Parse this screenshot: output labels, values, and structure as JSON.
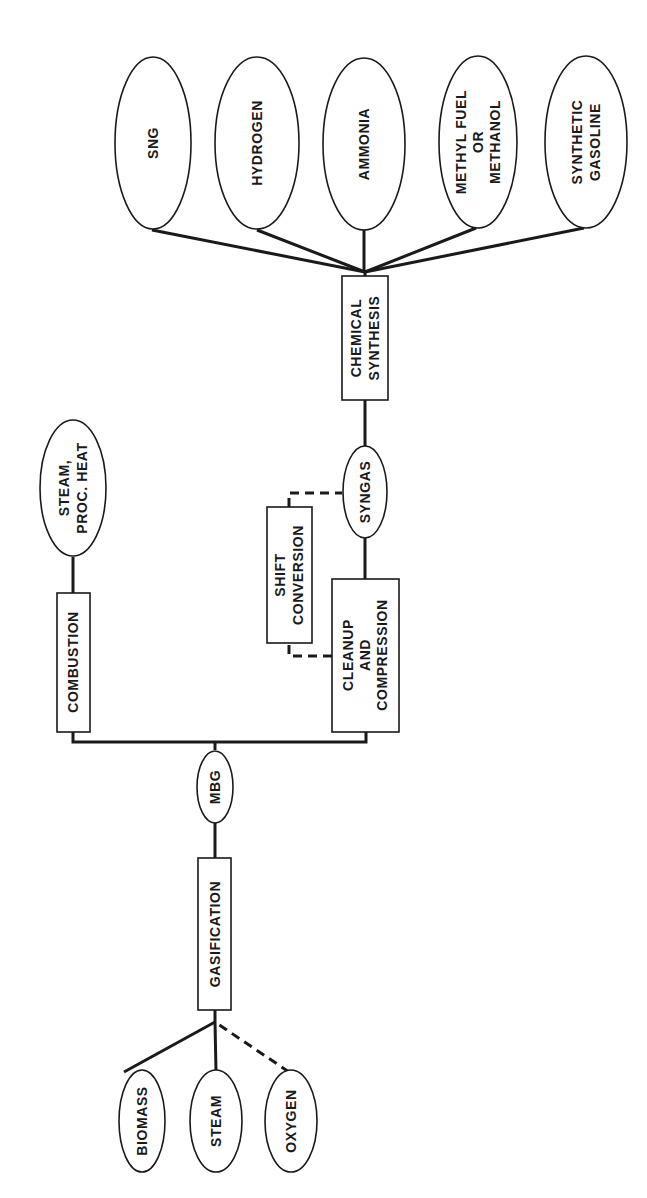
{
  "diagram": {
    "orientation": "rotated-90-ccw",
    "inputs": [
      {
        "id": "biomass",
        "label": [
          "BIOMASS"
        ],
        "shape": "ellipse"
      },
      {
        "id": "steam",
        "label": [
          "STEAM"
        ],
        "shape": "ellipse"
      },
      {
        "id": "oxygen",
        "label": [
          "OXYGEN"
        ],
        "shape": "ellipse",
        "connection": "dashed"
      }
    ],
    "processes": [
      {
        "id": "gasification",
        "label": [
          "GASIFICATION"
        ],
        "shape": "box"
      },
      {
        "id": "mbg",
        "label": [
          "MBG"
        ],
        "shape": "ellipse"
      },
      {
        "id": "combustion",
        "label": [
          "COMBUSTION"
        ],
        "shape": "box"
      },
      {
        "id": "steam_proc_heat",
        "label": [
          "STEAM,",
          "PROC. HEAT"
        ],
        "shape": "ellipse"
      },
      {
        "id": "cleanup",
        "label": [
          "CLEANUP",
          "AND",
          "COMPRESSION"
        ],
        "shape": "box"
      },
      {
        "id": "shift",
        "label": [
          "SHIFT",
          "CONVERSION"
        ],
        "shape": "box"
      },
      {
        "id": "syngas",
        "label": [
          "SYNGAS"
        ],
        "shape": "ellipse"
      },
      {
        "id": "chemical_synthesis",
        "label": [
          "CHEMICAL",
          "SYNTHESIS"
        ],
        "shape": "box"
      }
    ],
    "products": [
      {
        "id": "sng",
        "label": [
          "SNG"
        ],
        "shape": "ellipse"
      },
      {
        "id": "hydrogen",
        "label": [
          "HYDROGEN"
        ],
        "shape": "ellipse"
      },
      {
        "id": "ammonia",
        "label": [
          "AMMONIA"
        ],
        "shape": "ellipse"
      },
      {
        "id": "methyl",
        "label": [
          "METHYL FUEL",
          "OR",
          "METHANOL"
        ],
        "shape": "ellipse"
      },
      {
        "id": "gasoline",
        "label": [
          "SYNTHETIC",
          "GASOLINE"
        ],
        "shape": "ellipse"
      }
    ],
    "edges": [
      {
        "from": "biomass",
        "to": "gasification",
        "style": "solid"
      },
      {
        "from": "steam",
        "to": "gasification",
        "style": "solid"
      },
      {
        "from": "oxygen",
        "to": "gasification",
        "style": "dashed"
      },
      {
        "from": "gasification",
        "to": "mbg",
        "style": "solid"
      },
      {
        "from": "mbg",
        "to": "combustion",
        "style": "solid"
      },
      {
        "from": "combustion",
        "to": "steam_proc_heat",
        "style": "solid"
      },
      {
        "from": "mbg",
        "to": "cleanup",
        "style": "solid"
      },
      {
        "from": "cleanup",
        "to": "shift",
        "style": "dashed"
      },
      {
        "from": "shift",
        "to": "syngas",
        "style": "dashed"
      },
      {
        "from": "cleanup",
        "to": "syngas",
        "style": "solid"
      },
      {
        "from": "syngas",
        "to": "chemical_synthesis",
        "style": "solid"
      },
      {
        "from": "chemical_synthesis",
        "to": "sng",
        "style": "solid"
      },
      {
        "from": "chemical_synthesis",
        "to": "hydrogen",
        "style": "solid"
      },
      {
        "from": "chemical_synthesis",
        "to": "ammonia",
        "style": "solid"
      },
      {
        "from": "chemical_synthesis",
        "to": "methyl",
        "style": "solid"
      },
      {
        "from": "chemical_synthesis",
        "to": "gasoline",
        "style": "solid"
      }
    ]
  },
  "labels": {
    "biomass": "BIOMASS",
    "steam": "STEAM",
    "oxygen": "OXYGEN",
    "gasification": "GASIFICATION",
    "mbg": "MBG",
    "combustion": "COMBUSTION",
    "steam_proc_heat_1": "STEAM,",
    "steam_proc_heat_2": "PROC. HEAT",
    "cleanup_1": "CLEANUP",
    "cleanup_2": "AND",
    "cleanup_3": "COMPRESSION",
    "shift_1": "SHIFT",
    "shift_2": "CONVERSION",
    "syngas": "SYNGAS",
    "chem_1": "CHEMICAL",
    "chem_2": "SYNTHESIS",
    "sng": "SNG",
    "hydrogen": "HYDROGEN",
    "ammonia": "AMMONIA",
    "methyl_1": "METHYL FUEL",
    "methyl_2": "OR",
    "methyl_3": "METHANOL",
    "gasoline_1": "SYNTHETIC",
    "gasoline_2": "GASOLINE"
  },
  "colors": {
    "ink": "#1a1a1a",
    "paper": "#ffffff"
  }
}
